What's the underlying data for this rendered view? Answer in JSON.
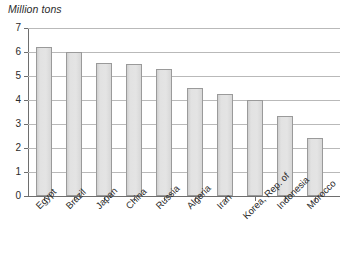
{
  "chart_data": {
    "type": "bar",
    "title": "Million tons",
    "xlabel": "",
    "ylabel": "Million tons",
    "ylim": [
      0,
      7
    ],
    "ytick_labels": [
      "7",
      "6",
      "5",
      "4",
      "3",
      "2",
      "1",
      "0"
    ],
    "ytick_values": [
      7,
      6,
      5,
      4,
      3,
      2,
      1,
      0
    ],
    "grid": true,
    "legend": "none",
    "categories": [
      "Egypt",
      "Brazil",
      "Japan",
      "China",
      "Russia",
      "Algeria",
      "Iran",
      "Korea, Rep. of",
      "Indonesia",
      "Morocco"
    ],
    "values": [
      6.2,
      6.0,
      5.55,
      5.5,
      5.3,
      4.5,
      4.25,
      4.0,
      3.35,
      2.4
    ],
    "bar_color": "#dcdcdc",
    "bar_border_color": "#9a9a9a",
    "grid_color": "#b9b9b9",
    "axis_color": "#6e6e6e"
  }
}
